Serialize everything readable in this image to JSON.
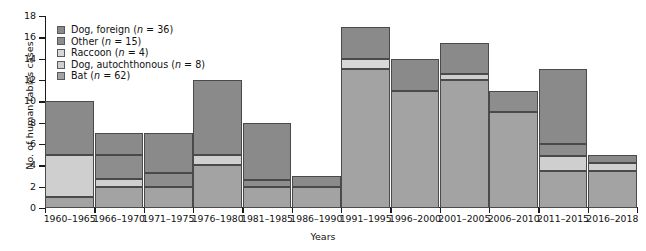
{
  "chart_data": {
    "type": "bar",
    "stacked": true,
    "title": "",
    "xlabel": "Years",
    "ylabel": "No. of human rabies cases",
    "ylim": [
      0,
      18
    ],
    "ytick_step": 2,
    "yticks": [
      0,
      2,
      4,
      6,
      8,
      10,
      12,
      14,
      16,
      18
    ],
    "grid": false,
    "legend_position": "top-left",
    "categories": [
      "1960–1965",
      "1966–1970",
      "1971–1975",
      "1976–1980",
      "1981–1985",
      "1986–1990",
      "1991–1995",
      "1996–2000",
      "2001–2005",
      "2006–2010",
      "2011–2015",
      "2016–2018"
    ],
    "series": [
      {
        "name": "Bat",
        "n": 62,
        "legend_label": "Bat (n = 62)",
        "color": "#a3a3a3",
        "values": [
          1,
          2,
          2,
          4,
          2,
          2,
          13,
          11,
          12,
          9,
          3.5,
          3.5
        ]
      },
      {
        "name": "Dog, autochthonous",
        "n": 8,
        "legend_label": "Dog, autochthonous (n = 8)",
        "color": "#cfcfcf",
        "values": [
          4,
          0.7,
          0,
          1,
          0,
          0,
          0,
          0,
          0.6,
          0,
          1.4,
          0.7
        ]
      },
      {
        "name": "Raccoon",
        "n": 4,
        "legend_label": "Raccoon (n = 4)",
        "color": "#d8d8d8",
        "values": [
          0,
          0,
          0,
          0,
          0,
          0,
          1,
          0,
          0,
          0,
          0,
          0
        ]
      },
      {
        "name": "Other",
        "n": 15,
        "legend_label": "Other (n = 15)",
        "color": "#8d8d8d",
        "values": [
          0,
          2.3,
          1.3,
          0,
          0.6,
          0,
          0,
          0,
          0,
          2,
          1.1,
          0
        ]
      },
      {
        "name": "Dog, foreign",
        "n": 36,
        "legend_label": "Dog, foreign (n = 36)",
        "color": "#8a8a8a",
        "values": [
          5,
          2,
          3.7,
          7,
          5.4,
          1,
          3,
          3,
          2.9,
          0,
          7,
          0.8
        ]
      }
    ],
    "totals": [
      10,
      7,
      7,
      12,
      8,
      3,
      17,
      14,
      15.5,
      11,
      13,
      5
    ],
    "legend_order": [
      "Dog, foreign (n = 36)",
      "Other (n = 15)",
      "Raccoon (n = 4)",
      "Dog, autochthonous (n = 8)",
      "Bat (n = 62)"
    ]
  }
}
